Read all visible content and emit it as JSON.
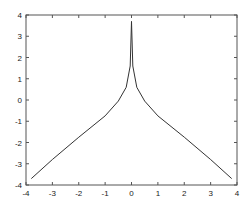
{
  "chart_data": {
    "type": "line",
    "title": "",
    "xlabel": "",
    "ylabel": "",
    "xlim": [
      -4,
      4
    ],
    "ylim": [
      -4,
      4
    ],
    "grid": false,
    "legend": null,
    "xticks": [
      "-4",
      "-3",
      "-2",
      "-1",
      "0",
      "1",
      "2",
      "3",
      "4"
    ],
    "yticks": [
      "-4",
      "-3",
      "-2",
      "-1",
      "0",
      "1",
      "2",
      "3",
      "4"
    ],
    "series": [
      {
        "name": "curve",
        "color": "#333333",
        "x": [
          -3.8,
          -3.0,
          -2.0,
          -1.0,
          -0.5,
          -0.2,
          -0.05,
          0.0,
          0.05,
          0.2,
          0.5,
          1.0,
          2.0,
          3.0,
          3.8
        ],
        "y": [
          -3.7,
          -2.8,
          -1.75,
          -0.75,
          -0.05,
          0.6,
          1.6,
          3.7,
          1.6,
          0.6,
          -0.05,
          -0.75,
          -1.75,
          -2.8,
          -3.7
        ]
      }
    ]
  }
}
